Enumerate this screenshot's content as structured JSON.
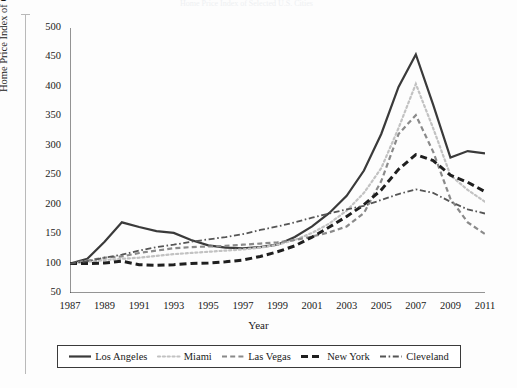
{
  "figure": {
    "background_color": "#fdfdfd",
    "ghost_top_text": "Home Price Index of Selected U.S. Cities"
  },
  "axis": {
    "y_title": "Home Price Index of Cities",
    "x_title": "Year",
    "y_ticks": [
      50,
      100,
      150,
      200,
      250,
      300,
      350,
      400,
      450,
      500
    ],
    "x_ticks": [
      1987,
      1989,
      1991,
      1993,
      1995,
      1997,
      1999,
      2001,
      2003,
      2005,
      2007,
      2009,
      2011
    ]
  },
  "legend": {
    "items": [
      {
        "label": "Los Angeles",
        "style": "solid",
        "color": "#3a3a3a",
        "width": 2.2
      },
      {
        "label": "Miami",
        "style": "dotted",
        "color": "#c2c2c2",
        "width": 2.2
      },
      {
        "label": "Las Vegas",
        "style": "dashed",
        "color": "#8a8a8a",
        "width": 2.2
      },
      {
        "label": "New York",
        "style": "dashed-bold",
        "color": "#1f1f1f",
        "width": 3.0
      },
      {
        "label": "Cleveland",
        "style": "dash-dot",
        "color": "#555555",
        "width": 1.8
      }
    ]
  },
  "chart_data": {
    "type": "line",
    "title": "",
    "xlabel": "Year",
    "ylabel": "Home Price Index of Cities",
    "xlim": [
      1987,
      2011
    ],
    "ylim": [
      50,
      500
    ],
    "grid": false,
    "legend_position": "bottom",
    "x": [
      1987,
      1988,
      1989,
      1990,
      1991,
      1992,
      1993,
      1994,
      1995,
      1996,
      1997,
      1998,
      1999,
      2000,
      2001,
      2002,
      2003,
      2004,
      2005,
      2006,
      2007,
      2008,
      2009,
      2010,
      2011
    ],
    "series": [
      {
        "name": "Los Angeles",
        "values": [
          100,
          108,
          137,
          170,
          162,
          155,
          152,
          140,
          131,
          127,
          126,
          128,
          132,
          145,
          163,
          186,
          215,
          258,
          320,
          400,
          455,
          370,
          280,
          291,
          287
        ]
      },
      {
        "name": "Miami",
        "values": [
          100,
          103,
          106,
          108,
          110,
          113,
          116,
          118,
          120,
          122,
          124,
          127,
          132,
          140,
          152,
          168,
          190,
          220,
          262,
          330,
          405,
          330,
          250,
          225,
          205
        ]
      },
      {
        "name": "Las Vegas",
        "values": [
          100,
          105,
          110,
          112,
          118,
          122,
          126,
          128,
          129,
          130,
          132,
          134,
          136,
          140,
          146,
          153,
          163,
          186,
          240,
          320,
          352,
          290,
          210,
          170,
          150
        ]
      },
      {
        "name": "New York",
        "values": [
          100,
          100,
          101,
          104,
          98,
          97,
          98,
          100,
          101,
          103,
          106,
          112,
          120,
          130,
          145,
          162,
          180,
          200,
          225,
          260,
          285,
          275,
          250,
          238,
          222
        ]
      },
      {
        "name": "Cleveland",
        "values": [
          100,
          104,
          110,
          115,
          122,
          128,
          132,
          137,
          141,
          145,
          150,
          157,
          163,
          170,
          178,
          185,
          192,
          198,
          208,
          218,
          226,
          220,
          205,
          192,
          185
        ]
      }
    ]
  }
}
